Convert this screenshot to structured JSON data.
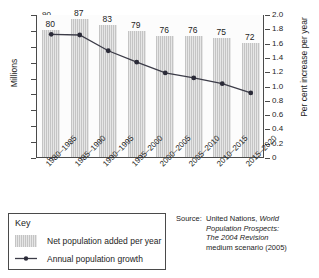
{
  "chart_data": {
    "type": "bar",
    "title": "",
    "subtitle": "",
    "xlabel": "",
    "ylabel": "Millions",
    "y2label": "Per cent increase per year",
    "categories": [
      "1980–1985",
      "1985–1990",
      "1990–1995",
      "1995–2000",
      "2000–2005",
      "2005–2010",
      "2010–2015",
      "2015–2020"
    ],
    "series": [
      {
        "name": "Net population added per year",
        "type": "bar",
        "axis": "left",
        "unit": "Millions",
        "values": [
          80,
          87,
          83,
          79,
          76,
          76,
          75,
          72
        ],
        "data_labels": [
          "80",
          "87",
          "83",
          "79",
          "76",
          "76",
          "75",
          "72"
        ]
      },
      {
        "name": "Annual population growth",
        "type": "line",
        "axis": "right",
        "unit": "Per cent increase per year",
        "values": [
          1.73,
          1.72,
          1.5,
          1.34,
          1.19,
          1.12,
          1.04,
          0.91
        ]
      }
    ],
    "ylim": [
      0,
      90
    ],
    "yticks": [
      0,
      10,
      20,
      30,
      40,
      50,
      60,
      70,
      80,
      90
    ],
    "ytick_labels": [
      "0",
      "10",
      "20",
      "30",
      "40",
      "50",
      "60",
      "70",
      "80",
      "90"
    ],
    "y2lim": [
      0,
      2.0
    ],
    "y2ticks": [
      0,
      0.2,
      0.4,
      0.6,
      0.8,
      1.0,
      1.2,
      1.4,
      1.6,
      1.8,
      2.0
    ],
    "y2tick_labels": [
      "0",
      "0.2",
      "0.4",
      "0.6",
      "0.8",
      "1.0",
      "1.2",
      "1.4",
      "1.6",
      "1.8",
      "2.0"
    ],
    "grid": false,
    "legend_position": "below-left",
    "colors": {
      "bar_fill": "#dedede",
      "bar_hatch": "#c4c4c4",
      "line": "#3c3c48",
      "marker": "#2b2b38",
      "axis": "#4a4a4a",
      "text": "#1d1d1d"
    }
  },
  "legend": {
    "title": "Key",
    "items": [
      {
        "label": "Net population added per year",
        "marker": "bar-swatch"
      },
      {
        "label": "Annual population growth",
        "marker": "line-swatch"
      }
    ]
  },
  "source": {
    "label": "Source:",
    "lines": [
      {
        "text": "United Nations, ",
        "italic": false
      },
      {
        "text": "World",
        "italic": true
      },
      {
        "text": "Population Prospects:",
        "italic": true
      },
      {
        "text": "The 2004 Revision",
        "italic": true
      },
      {
        "text": "medium scenario (2005)",
        "italic": false
      }
    ],
    "full_text": "Source: United Nations, World Population Prospects: The 2004 Revision medium scenario (2005)"
  }
}
